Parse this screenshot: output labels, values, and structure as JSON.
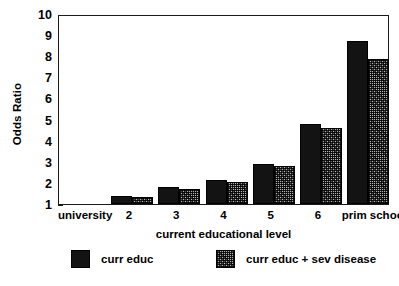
{
  "chart_data": {
    "type": "bar",
    "title": "",
    "xlabel": "current educational level",
    "ylabel": "Odds Ratio",
    "categories": [
      "university",
      "2",
      "3",
      "4",
      "5",
      "6",
      "prim school"
    ],
    "ylim": [
      1,
      10
    ],
    "yticks": [
      1,
      2,
      3,
      4,
      5,
      6,
      7,
      8,
      9,
      10
    ],
    "ytick_labels": [
      "1",
      "2",
      "3",
      "4",
      "5",
      "6",
      "7",
      "8",
      "9",
      "10"
    ],
    "grid": false,
    "legend_position": "bottom",
    "series": [
      {
        "name": "curr educ",
        "color": "#131313",
        "fill": "solid-black",
        "values": [
          1.0,
          1.4,
          1.8,
          2.15,
          2.9,
          4.8,
          8.7
        ]
      },
      {
        "name": "curr educ + sev disease",
        "color": "#8e8e8e",
        "fill": "speckled-gray",
        "values": [
          1.0,
          1.35,
          1.7,
          2.05,
          2.8,
          4.6,
          7.85
        ]
      }
    ]
  },
  "legend": {
    "entries": [
      {
        "label": "curr educ"
      },
      {
        "label": "curr educ + sev disease"
      }
    ]
  },
  "colors": {
    "series_black": "#131313",
    "series_gray": "#8e8e8e",
    "axis": "#1a1a1a",
    "background": "#ffffff"
  }
}
